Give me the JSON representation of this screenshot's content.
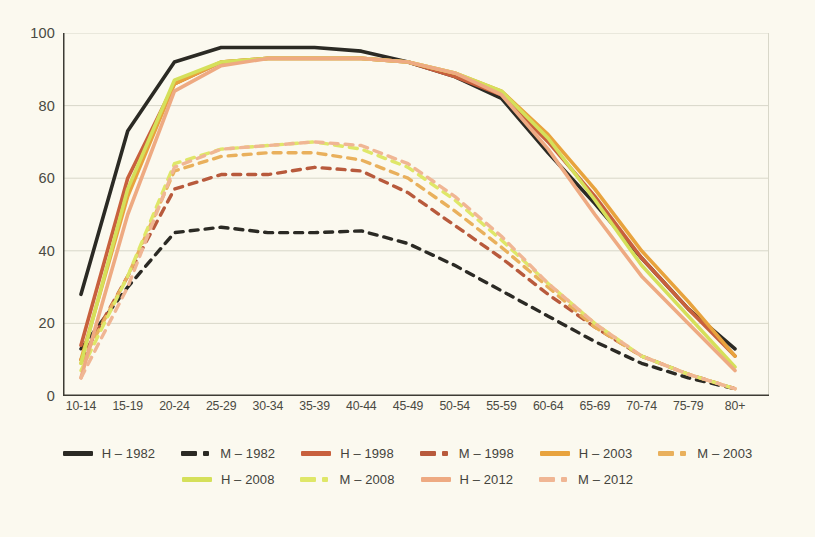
{
  "chart_data": {
    "type": "line",
    "title": "",
    "xlabel": "",
    "ylabel": "",
    "ylim": [
      0,
      100
    ],
    "yticks": [
      0,
      20,
      40,
      60,
      80,
      100
    ],
    "grid": true,
    "legend_position": "bottom",
    "categories": [
      "10-14",
      "15-19",
      "20-24",
      "25-29",
      "30-34",
      "35-39",
      "40-44",
      "45-49",
      "50-54",
      "55-59",
      "60-64",
      "65-69",
      "70-74",
      "75-79",
      "80+"
    ],
    "series": [
      {
        "name": "H – 1982",
        "key": "H-1982",
        "color": "#2b2a24",
        "style": "solid",
        "values": [
          28,
          73,
          92,
          96,
          96,
          96,
          95,
          92,
          88,
          82,
          67,
          53,
          38,
          24,
          13
        ]
      },
      {
        "name": "M – 1982",
        "key": "M-1982",
        "color": "#2b2a24",
        "style": "dashed",
        "values": [
          13,
          30,
          45,
          46.5,
          45,
          45,
          45.5,
          42,
          36,
          29,
          22,
          15,
          9,
          5,
          2
        ]
      },
      {
        "name": "H – 1998",
        "key": "H-1998",
        "color": "#c8603d",
        "style": "solid",
        "values": [
          14,
          60,
          86,
          92,
          93,
          93,
          93,
          92,
          88,
          83,
          70,
          55,
          38,
          24,
          11
        ]
      },
      {
        "name": "M – 1998",
        "key": "M-1998",
        "color": "#b85a3c",
        "style": "dashed",
        "values": [
          10,
          33,
          57,
          61,
          61,
          63,
          62,
          56,
          47,
          38,
          28,
          19,
          11,
          6,
          2
        ]
      },
      {
        "name": "H – 2003",
        "key": "H-2003",
        "color": "#e8a33d",
        "style": "solid",
        "values": [
          10,
          55,
          86,
          92,
          93,
          93,
          93,
          92,
          89,
          84,
          72,
          57,
          40,
          26,
          11
        ]
      },
      {
        "name": "M – 2003",
        "key": "M-2003",
        "color": "#e9b05c",
        "style": "dashed",
        "values": [
          9,
          33,
          62,
          66,
          67,
          67,
          65,
          60,
          51,
          41,
          30,
          19,
          11,
          6,
          2
        ]
      },
      {
        "name": "H – 2008",
        "key": "H-2008",
        "color": "#d5e05a",
        "style": "solid",
        "values": [
          9,
          57,
          87,
          92,
          93,
          93,
          93,
          92,
          89,
          84,
          71,
          54,
          36,
          22,
          8
        ]
      },
      {
        "name": "M – 2008",
        "key": "M-2008",
        "color": "#dfe768",
        "style": "dashed",
        "values": [
          7,
          33,
          64,
          68,
          69,
          70,
          68,
          63,
          54,
          43,
          31,
          20,
          11,
          6,
          2
        ]
      },
      {
        "name": "H – 2012",
        "key": "H-2012",
        "color": "#eeaa82",
        "style": "solid",
        "values": [
          5,
          50,
          84,
          91,
          93,
          93,
          93,
          92,
          89,
          83,
          68,
          50,
          33,
          20,
          7
        ]
      },
      {
        "name": "M – 2012",
        "key": "M-2012",
        "color": "#f0b694",
        "style": "dashed",
        "values": [
          5,
          30,
          63,
          68,
          69,
          70,
          69,
          64,
          55,
          44,
          31,
          20,
          11,
          6,
          2
        ]
      }
    ]
  },
  "axes": {
    "y_ticks": [
      "0",
      "20",
      "40",
      "60",
      "80",
      "100"
    ],
    "x_ticks": [
      "10-14",
      "15-19",
      "20-24",
      "25-29",
      "30-34",
      "35-39",
      "40-44",
      "45-49",
      "50-54",
      "55-59",
      "60-64",
      "65-69",
      "70-74",
      "75-79",
      "80+"
    ]
  },
  "legend": {
    "rows": [
      [
        "H – 1982",
        "M – 1982",
        "H – 1998",
        "M – 1998",
        "H – 2003",
        "M – 2003"
      ],
      [
        "H – 2008",
        "M – 2008",
        "H – 2012",
        "M – 2012"
      ]
    ]
  },
  "colors": {
    "background": "#fbf9ef",
    "axis": "#3d3c35",
    "grid": "#d8d7c9",
    "text": "#4a4a42"
  }
}
